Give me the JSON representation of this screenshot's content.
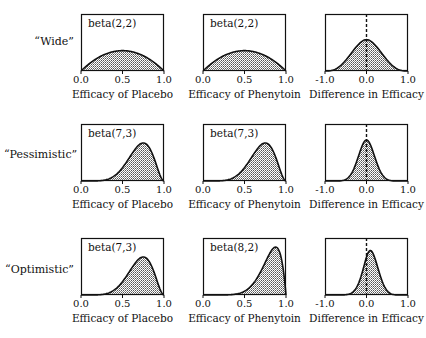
{
  "chart_data": {
    "type": "area",
    "title": "",
    "layout": "3x3 grid of density plots",
    "rows": [
      {
        "label": "“Wide”",
        "panels": [
          {
            "annotation": "beta(2,2)",
            "xlabel": "Efficacy of Placebo",
            "xticks": [
              "0.0",
              "0.5",
              "1.0"
            ],
            "xlim": [
              0,
              1
            ],
            "dist": {
              "a": 2,
              "b": 2
            }
          },
          {
            "annotation": "beta(2,2)",
            "xlabel": "Efficacy of Phenytoin",
            "xticks": [
              "0.0",
              "0.5",
              "1.0"
            ],
            "xlim": [
              0,
              1
            ],
            "dist": {
              "a": 2,
              "b": 2
            }
          },
          {
            "annotation": "",
            "xlabel": "Difference in Efficacy",
            "xticks": [
              "-1.0",
              "0.0",
              "1.0"
            ],
            "xlim": [
              -1,
              1
            ],
            "diff": {
              "a1": 2,
              "b1": 2,
              "a2": 2,
              "b2": 2
            },
            "reference_line": 0
          }
        ]
      },
      {
        "label": "“Pessimistic”",
        "panels": [
          {
            "annotation": "beta(7,3)",
            "xlabel": "Efficacy of Placebo",
            "xticks": [
              "0.0",
              "0.5",
              "1.0"
            ],
            "xlim": [
              0,
              1
            ],
            "dist": {
              "a": 7,
              "b": 3
            }
          },
          {
            "annotation": "beta(7,3)",
            "xlabel": "Efficacy of Phenytoin",
            "xticks": [
              "0.0",
              "0.5",
              "1.0"
            ],
            "xlim": [
              0,
              1
            ],
            "dist": {
              "a": 7,
              "b": 3
            }
          },
          {
            "annotation": "",
            "xlabel": "Difference in Efficacy",
            "xticks": [
              "-1.0",
              "0.0",
              "1.0"
            ],
            "xlim": [
              -1,
              1
            ],
            "diff": {
              "a1": 7,
              "b1": 3,
              "a2": 7,
              "b2": 3
            },
            "reference_line": 0
          }
        ]
      },
      {
        "label": "“Optimistic”",
        "panels": [
          {
            "annotation": "beta(7,3)",
            "xlabel": "Efficacy of Placebo",
            "xticks": [
              "0.0",
              "0.5",
              "1.0"
            ],
            "xlim": [
              0,
              1
            ],
            "dist": {
              "a": 7,
              "b": 3
            }
          },
          {
            "annotation": "beta(8,2)",
            "xlabel": "Efficacy of Phenytoin",
            "xticks": [
              "0.0",
              "0.5",
              "1.0"
            ],
            "xlim": [
              0,
              1
            ],
            "dist": {
              "a": 8,
              "b": 2
            }
          },
          {
            "annotation": "",
            "xlabel": "Difference in Efficacy",
            "xticks": [
              "-1.0",
              "0.0",
              "1.0"
            ],
            "xlim": [
              -1,
              1
            ],
            "diff": {
              "a1": 7,
              "b1": 3,
              "a2": 8,
              "b2": 2
            },
            "reference_line": 0
          }
        ]
      }
    ],
    "grid": false,
    "legend": "none"
  },
  "rows": [
    {
      "label": "“Wide”"
    },
    {
      "label": "“Pessimistic”"
    },
    {
      "label": "“Optimistic”"
    }
  ],
  "colors": {
    "fill": "#9a9a9a",
    "line": "#111111",
    "frame": "#111111"
  }
}
